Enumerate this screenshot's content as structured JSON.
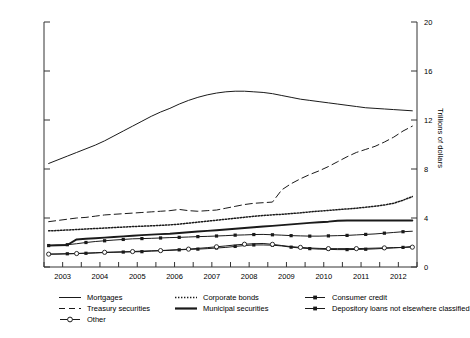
{
  "chart_data": {
    "type": "line",
    "title": "",
    "xlabel": "",
    "ylabel": "Trillions of dollars",
    "ylabel_left": "Quarterly",
    "xlim": [
      2002.5,
      2012.5
    ],
    "ylim": [
      0,
      20
    ],
    "grid": false,
    "legend_position": "below-axes",
    "xticks": [
      2003,
      2004,
      2005,
      2006,
      2007,
      2008,
      2009,
      2010,
      2011,
      2012
    ],
    "xtick_labels": [
      "2003",
      "2004",
      "2005",
      "2006",
      "2007",
      "2008",
      "2009",
      "2010",
      "2011",
      "2012"
    ],
    "yticks": [
      0,
      4,
      8,
      12,
      16,
      20
    ],
    "ytick_labels": [
      "0",
      "4",
      "8",
      "12",
      "16",
      "20"
    ],
    "x": [
      2002.625,
      2002.875,
      2003.125,
      2003.375,
      2003.625,
      2003.875,
      2004.125,
      2004.375,
      2004.625,
      2004.875,
      2005.125,
      2005.375,
      2005.625,
      2005.875,
      2006.125,
      2006.375,
      2006.625,
      2006.875,
      2007.125,
      2007.375,
      2007.625,
      2007.875,
      2008.125,
      2008.375,
      2008.625,
      2008.875,
      2009.125,
      2009.375,
      2009.625,
      2009.875,
      2010.125,
      2010.375,
      2010.625,
      2010.875,
      2011.125,
      2011.375,
      2011.625,
      2011.875,
      2012.125,
      2012.375
    ],
    "series": [
      {
        "name": "Mortgages",
        "style": "solid-thin",
        "marker": "none",
        "values": [
          8.45,
          8.75,
          9.05,
          9.35,
          9.65,
          9.95,
          10.3,
          10.7,
          11.1,
          11.5,
          11.9,
          12.3,
          12.65,
          12.95,
          13.3,
          13.6,
          13.85,
          14.05,
          14.2,
          14.3,
          14.35,
          14.35,
          14.3,
          14.25,
          14.15,
          14.0,
          13.85,
          13.7,
          13.6,
          13.5,
          13.4,
          13.3,
          13.2,
          13.1,
          13.0,
          12.95,
          12.9,
          12.85,
          12.8,
          12.75
        ]
      },
      {
        "name": "Treasury securities",
        "style": "dashed",
        "marker": "none",
        "values": [
          3.7,
          3.8,
          3.9,
          4.0,
          4.05,
          4.15,
          4.25,
          4.3,
          4.35,
          4.4,
          4.45,
          4.5,
          4.55,
          4.6,
          4.7,
          4.6,
          4.55,
          4.6,
          4.65,
          4.8,
          4.95,
          5.1,
          5.2,
          5.25,
          5.3,
          6.3,
          6.8,
          7.2,
          7.55,
          7.85,
          8.2,
          8.6,
          9.0,
          9.35,
          9.6,
          9.85,
          10.2,
          10.6,
          11.1,
          11.5
        ]
      },
      {
        "name": "Corporate bonds",
        "style": "dotted",
        "marker": "none",
        "values": [
          2.95,
          2.98,
          3.02,
          3.06,
          3.1,
          3.14,
          3.18,
          3.22,
          3.26,
          3.3,
          3.33,
          3.36,
          3.4,
          3.44,
          3.5,
          3.58,
          3.66,
          3.74,
          3.82,
          3.9,
          3.98,
          4.06,
          4.14,
          4.2,
          4.26,
          4.3,
          4.36,
          4.42,
          4.5,
          4.56,
          4.62,
          4.68,
          4.74,
          4.8,
          4.88,
          4.96,
          5.06,
          5.2,
          5.45,
          5.75
        ]
      },
      {
        "name": "Municipal securities",
        "style": "solid-thick",
        "marker": "none",
        "values": [
          1.75,
          1.78,
          1.8,
          2.25,
          2.3,
          2.35,
          2.4,
          2.45,
          2.5,
          2.55,
          2.6,
          2.64,
          2.68,
          2.72,
          2.78,
          2.84,
          2.9,
          2.95,
          3.0,
          3.06,
          3.12,
          3.18,
          3.24,
          3.3,
          3.36,
          3.42,
          3.48,
          3.54,
          3.6,
          3.65,
          3.7,
          3.78,
          3.8,
          3.8,
          3.8,
          3.8,
          3.8,
          3.8,
          3.8,
          3.8
        ]
      },
      {
        "name": "Consumer credit",
        "style": "solid-thin",
        "marker": "filled-square",
        "values": [
          1.75,
          1.78,
          1.82,
          1.9,
          2.0,
          2.08,
          2.14,
          2.2,
          2.25,
          2.3,
          2.32,
          2.34,
          2.37,
          2.4,
          2.42,
          2.45,
          2.48,
          2.5,
          2.53,
          2.56,
          2.6,
          2.62,
          2.65,
          2.66,
          2.63,
          2.6,
          2.56,
          2.54,
          2.52,
          2.52,
          2.54,
          2.56,
          2.58,
          2.62,
          2.66,
          2.7,
          2.76,
          2.82,
          2.88,
          2.92
        ]
      },
      {
        "name": "Depository loans not elsewhere classified",
        "style": "solid-thin",
        "marker": "filled-square",
        "values": [
          1.05,
          1.06,
          1.08,
          1.1,
          1.12,
          1.15,
          1.18,
          1.2,
          1.22,
          1.24,
          1.25,
          1.3,
          1.33,
          1.36,
          1.4,
          1.44,
          1.46,
          1.5,
          1.55,
          1.6,
          1.68,
          1.75,
          1.8,
          1.8,
          1.78,
          1.72,
          1.62,
          1.55,
          1.5,
          1.46,
          1.44,
          1.42,
          1.42,
          1.43,
          1.45,
          1.48,
          1.52,
          1.56,
          1.6,
          1.68
        ]
      },
      {
        "name": "Other",
        "style": "solid-thin",
        "marker": "open-circle",
        "values": [
          1.05,
          1.06,
          1.08,
          1.1,
          1.13,
          1.16,
          1.2,
          1.22,
          1.24,
          1.26,
          1.3,
          1.32,
          1.34,
          1.38,
          1.42,
          1.46,
          1.52,
          1.58,
          1.65,
          1.72,
          1.8,
          1.86,
          1.9,
          1.92,
          1.85,
          1.75,
          1.66,
          1.6,
          1.55,
          1.52,
          1.5,
          1.5,
          1.5,
          1.5,
          1.52,
          1.54,
          1.56,
          1.58,
          1.6,
          1.62
        ]
      }
    ]
  },
  "axes": {
    "left_title": "Quarterly",
    "right_title": "Trillions of dollars"
  },
  "legend": {
    "rows": [
      [
        {
          "label": "Mortgages",
          "swatch": "solid-thin-line"
        },
        {
          "label": "Corporate bonds",
          "swatch": "dotted-line"
        },
        {
          "label": "Consumer credit",
          "swatch": "square-marker-line"
        }
      ],
      [
        {
          "label": "Treasury securities",
          "swatch": "dashed-line"
        },
        {
          "label": "Municipal securities",
          "swatch": "solid-thick-line"
        },
        {
          "label": "Depository loans not elsewhere classified",
          "swatch": "square-marker-line"
        }
      ],
      [
        {
          "label": "Other",
          "swatch": "circle-marker-line"
        }
      ]
    ]
  },
  "caption": "",
  "colors": {
    "line": "#1a1a1a",
    "axis": "#333333",
    "background": "#ffffff"
  }
}
